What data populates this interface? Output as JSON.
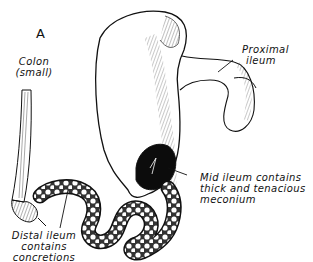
{
  "figure": {
    "panel_letter": "A",
    "labels": {
      "colon": [
        "Colon",
        "(small)"
      ],
      "proximal_ileum": [
        "Proximal",
        "ileum"
      ],
      "mid_ileum": [
        "Mid ileum contains",
        "thick and tenacious",
        "meconium"
      ],
      "distal_ileum": [
        "Distal ileum",
        "contains",
        "concretions"
      ]
    },
    "colors": {
      "ink": "#111111",
      "background": "#ffffff",
      "meconium": "#0c0c0c"
    }
  }
}
